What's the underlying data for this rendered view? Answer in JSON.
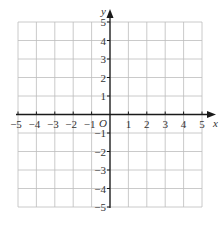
{
  "diagram": {
    "type": "coordinate-plane",
    "x_axis": {
      "label": "x",
      "min": -5,
      "max": 5,
      "step": 1
    },
    "y_axis": {
      "label": "y",
      "min": -5,
      "max": 5,
      "step": 1
    },
    "origin_label": "O",
    "x_tick_labels": [
      "−5",
      "−4",
      "−3",
      "−2",
      "−1",
      "1",
      "2",
      "3",
      "4",
      "5"
    ],
    "x_tick_values": [
      -5,
      -4,
      -3,
      -2,
      -1,
      1,
      2,
      3,
      4,
      5
    ],
    "y_tick_labels": [
      "5",
      "4",
      "3",
      "2",
      "1",
      "−1",
      "−2",
      "−3",
      "−4",
      "−5"
    ],
    "y_tick_values": [
      5,
      4,
      3,
      2,
      1,
      -1,
      -2,
      -3,
      -4,
      -5
    ],
    "grid": true,
    "colors": {
      "grid": "#bdbdbd",
      "axis": "#1a1a1a",
      "text": "#333333"
    }
  }
}
